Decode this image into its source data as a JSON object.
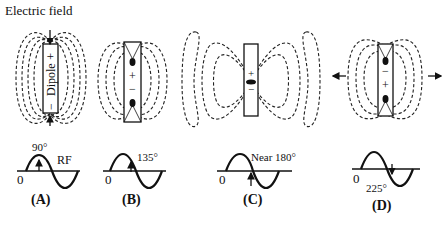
{
  "title": "Electric field",
  "colors": {
    "ink": "#111111",
    "background": "#ffffff"
  },
  "panels": [
    {
      "id": "A",
      "label": "(A)",
      "phase_label": "90°",
      "extra_label": "RF",
      "origin_label": "0",
      "dipole_text": "Dipole",
      "top_sign": "+",
      "bottom_sign": "−"
    },
    {
      "id": "B",
      "label": "(B)",
      "phase_label": "135°",
      "origin_label": "0",
      "top_sign": "+",
      "bottom_sign": "−"
    },
    {
      "id": "C",
      "label": "(C)",
      "phase_label": "Near 180°",
      "origin_label": "0",
      "top_sign": "+",
      "bottom_sign": "−"
    },
    {
      "id": "D",
      "label": "(D)",
      "phase_label": "225°",
      "origin_label": "0",
      "top_sign": "−",
      "bottom_sign": "+"
    }
  ]
}
